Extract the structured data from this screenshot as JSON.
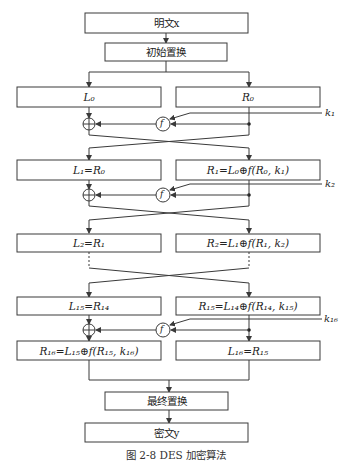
{
  "diagram": {
    "title_caption": "图 2-8   DES 加密算法",
    "input": "明文x",
    "initial_permutation": "初始置换",
    "final_permutation": "最终置换",
    "output": "密文y",
    "rounds": [
      {
        "left": "L₀",
        "right": "R₀",
        "key": "k₁"
      },
      {
        "left": "L₁=R₀",
        "right": "R₁=L₀⊕f(R₀, k₁)",
        "key": "k₂"
      },
      {
        "left": "L₂=R₁",
        "right": "R₂=L₁⊕f(R₁, k₂)"
      },
      {
        "left": "L₁₅=R₁₄",
        "right": "R₁₅=L₁₄⊕f(R₁₄, k₁₅)",
        "key": "k₁₆"
      },
      {
        "left": "R₁₆=L₁₅⊕f(R₁₅, k₁₆)",
        "right": "L₁₆=R₁₅"
      }
    ],
    "function_label": "f",
    "xor_symbol": "⊕"
  }
}
